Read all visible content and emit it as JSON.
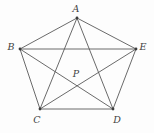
{
  "diagram": {
    "colors": {
      "background": "#fdfdfd",
      "line": "#595959",
      "dot": "#3c3c3c",
      "label": "#3f3f3f"
    },
    "line_width": 0.9,
    "dot_radius": 1.4,
    "points": [
      {
        "id": "A",
        "label": "A",
        "x": 77,
        "y": 18,
        "label_x": 76,
        "label_y": 9,
        "dot": true
      },
      {
        "id": "B",
        "label": "B",
        "x": 20,
        "y": 49,
        "label_x": 11,
        "label_y": 47,
        "dot": true
      },
      {
        "id": "C",
        "label": "C",
        "x": 40,
        "y": 109,
        "label_x": 37,
        "label_y": 120,
        "dot": true
      },
      {
        "id": "D",
        "label": "D",
        "x": 113,
        "y": 109,
        "label_x": 117,
        "label_y": 120,
        "dot": true
      },
      {
        "id": "E",
        "label": "E",
        "x": 136,
        "y": 49,
        "label_x": 143,
        "label_y": 47,
        "dot": true
      },
      {
        "id": "P",
        "label": "P",
        "x": 76,
        "y": 86,
        "label_x": 76,
        "label_y": 74,
        "dot": false
      }
    ],
    "segments": [
      [
        "A",
        "B"
      ],
      [
        "A",
        "E"
      ],
      [
        "B",
        "C"
      ],
      [
        "C",
        "D"
      ],
      [
        "D",
        "E"
      ],
      [
        "B",
        "E"
      ],
      [
        "A",
        "C"
      ],
      [
        "A",
        "D"
      ],
      [
        "B",
        "D"
      ],
      [
        "C",
        "E"
      ]
    ]
  }
}
